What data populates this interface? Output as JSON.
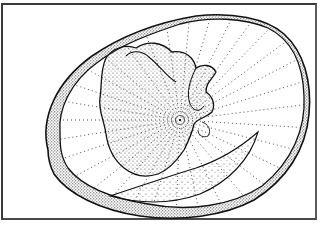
{
  "figure": {
    "frame_color": "#3a3a3a",
    "ink_color": "#1a1a1a",
    "background_color": "#ffffff"
  }
}
